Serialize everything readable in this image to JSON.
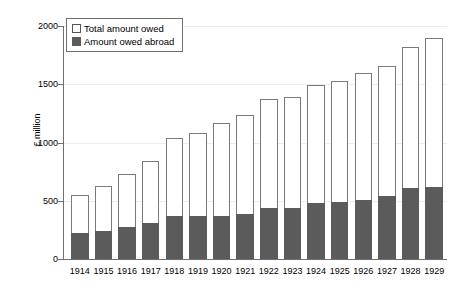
{
  "chart_data": {
    "type": "bar",
    "subtype": "stacked-overlay",
    "title": "",
    "xlabel": "",
    "ylabel": "£ million",
    "ylim": [
      0,
      2000
    ],
    "yticks": [
      0,
      500,
      1000,
      1500,
      2000
    ],
    "ytick_labels": [
      "0",
      "500",
      "1000",
      "1500",
      "2000"
    ],
    "grid": true,
    "legend_position": "top-left-inside",
    "categories": [
      "1914",
      "1915",
      "1916",
      "1917",
      "1918",
      "1919",
      "1920",
      "1921",
      "1922",
      "1923",
      "1924",
      "1925",
      "1926",
      "1927",
      "1928",
      "1929"
    ],
    "series": [
      {
        "name": "Total amount owed",
        "color": "#ffffff",
        "edge_color": "#7a7a7a",
        "values": [
          550,
          630,
          730,
          840,
          1040,
          1080,
          1170,
          1240,
          1370,
          1390,
          1490,
          1530,
          1600,
          1660,
          1820,
          1900
        ]
      },
      {
        "name": "Amount owed abroad",
        "color": "#5b5b5b",
        "edge_color": "#5b5b5b",
        "values": [
          220,
          240,
          275,
          310,
          370,
          370,
          370,
          390,
          435,
          435,
          480,
          490,
          510,
          540,
          610,
          620
        ]
      }
    ]
  },
  "legend": {
    "items": [
      {
        "label": "Total amount owed",
        "swatch": "total"
      },
      {
        "label": "Amount owed abroad",
        "swatch": "abroad"
      }
    ]
  },
  "axes": {
    "y_title": "£ million"
  }
}
